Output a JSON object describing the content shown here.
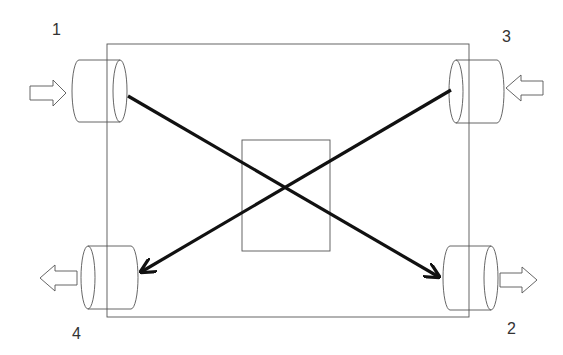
{
  "diagram": {
    "type": "four-port crossover schematic",
    "ports": [
      {
        "id": "1",
        "label": "1",
        "position": "top-left",
        "flow": "in"
      },
      {
        "id": "2",
        "label": "2",
        "position": "bottom-right",
        "flow": "out"
      },
      {
        "id": "3",
        "label": "3",
        "position": "top-right",
        "flow": "in"
      },
      {
        "id": "4",
        "label": "4",
        "position": "bottom-left",
        "flow": "out"
      }
    ],
    "connections": [
      {
        "from": "1",
        "to": "2"
      },
      {
        "from": "3",
        "to": "4"
      }
    ],
    "colors": {
      "outline": "#555555",
      "connection": "#111111",
      "background": "#ffffff"
    }
  }
}
